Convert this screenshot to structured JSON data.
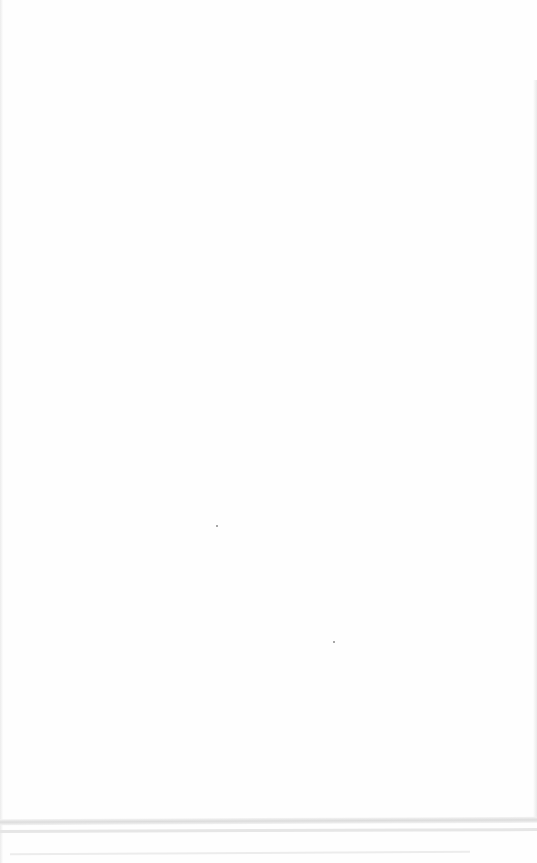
{
  "document": {
    "text": "",
    "specks": [
      {
        "x": 216,
        "y": 525
      },
      {
        "x": 333,
        "y": 641
      }
    ]
  }
}
